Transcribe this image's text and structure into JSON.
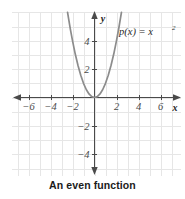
{
  "caption": "An even function",
  "chart_data": {
    "type": "line",
    "title": "",
    "subtitle": "",
    "function_label": "p(x) = x",
    "function_label_exponent": "2",
    "function_expression": "p(x) = x^2",
    "xlabel": "x",
    "ylabel": "y",
    "xlim": [
      -7.5,
      7.8
    ],
    "ylim": [
      -6.0,
      5.9
    ],
    "xticks": [
      -6,
      -4,
      -2,
      2,
      4,
      6
    ],
    "xtick_labels": [
      "−6",
      "−4",
      "−2",
      "2",
      "4",
      "6"
    ],
    "yticks": [
      4,
      2,
      -2,
      -4
    ],
    "ytick_labels": [
      "4",
      "2",
      "−2",
      "−4"
    ],
    "grid": true,
    "grid_spacing_x": 1,
    "grid_spacing_y": 1,
    "legend": "none",
    "series": [
      {
        "name": "p(x) = x^2",
        "color": "#8c8c8c",
        "x": [
          -2.45,
          -2.2,
          -2.0,
          -1.75,
          -1.5,
          -1.25,
          -1.0,
          -0.75,
          -0.5,
          -0.25,
          0,
          0.25,
          0.5,
          0.75,
          1.0,
          1.25,
          1.5,
          1.75,
          2.0,
          2.2,
          2.45
        ],
        "y": [
          6.0,
          4.84,
          4.0,
          3.06,
          2.25,
          1.5625,
          1.0,
          0.5625,
          0.25,
          0.0625,
          0,
          0.0625,
          0.25,
          0.5625,
          1.0,
          1.5625,
          2.25,
          3.06,
          4.0,
          4.84,
          6.0
        ]
      }
    ]
  },
  "colors": {
    "curve": "#8c8c8c",
    "axis": "#4a4a4a",
    "grid": "#e4e4e4",
    "text": "#1b1b1b"
  }
}
